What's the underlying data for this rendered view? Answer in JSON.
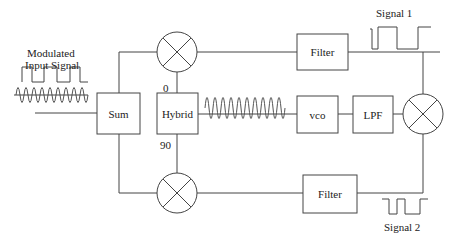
{
  "diagram": {
    "input_label_line1": "Modulated",
    "input_label_line2": "Input Signal",
    "blocks": {
      "sum": "Sum",
      "hybrid": "Hybrid",
      "vco": "vco",
      "lpf": "LPF",
      "filter_top": "Filter",
      "filter_bottom": "Filter"
    },
    "hybrid_ports": {
      "top": "0",
      "bottom": "90"
    },
    "outputs": {
      "signal1": "Signal 1",
      "signal2": "Signal 2"
    },
    "colors": {
      "line": "#444444",
      "background": "#ffffff"
    }
  }
}
